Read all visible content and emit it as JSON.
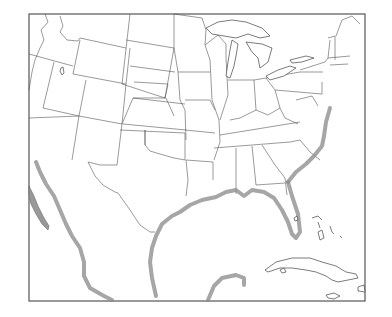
{
  "map": {
    "type": "outline map",
    "region": "Contiguous United States, northern Mexico and Caribbean",
    "frame": {
      "x": 29,
      "y": 14,
      "width": 336,
      "height": 287
    },
    "colors": {
      "background": "#ffffff",
      "frame": "#555555",
      "state_borders": "#555555",
      "coastal_shading": "#888888"
    },
    "features": [
      "state-boundaries",
      "great-lakes",
      "gulf-of-mexico-coastline",
      "atlantic-coastline",
      "florida",
      "cuba",
      "bahamas",
      "baja-california",
      "yucatan-peninsula"
    ]
  }
}
